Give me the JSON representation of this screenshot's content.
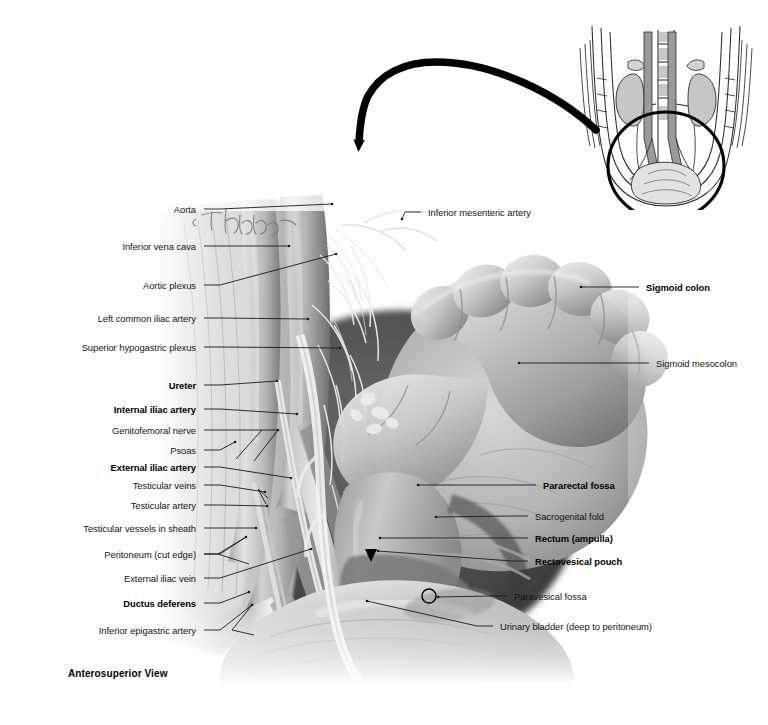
{
  "plate": {
    "view_label": "Anterosuperior View",
    "handwritten_mark": "T. Chubb",
    "illustration_type": "grayscale anatomical dissection photograph",
    "region": "male pelvis, peritoneum and posterior abdominal wall"
  },
  "labels_left": [
    {
      "id": "aorta",
      "text": "Aorta",
      "bold": false,
      "x": 196,
      "y": 209,
      "lx": 204,
      "ly": 209,
      "tx": 332,
      "ty": 204
    },
    {
      "id": "inferior-vena-cava",
      "text": "Inferior vena cava",
      "bold": false,
      "x": 196,
      "y": 246,
      "lx": 204,
      "ly": 246,
      "tx": 289,
      "ty": 246
    },
    {
      "id": "aortic-plexus",
      "text": "Aortic plexus",
      "bold": false,
      "x": 196,
      "y": 285,
      "lx": 204,
      "ly": 285,
      "tx": 336,
      "ty": 254
    },
    {
      "id": "left-common-iliac-artery",
      "text": "Left common iliac artery",
      "bold": false,
      "x": 196,
      "y": 318,
      "lx": 204,
      "ly": 318,
      "tx": 308,
      "ty": 319
    },
    {
      "id": "superior-hypogastric-plexus",
      "text": "Superior hypogastric plexus",
      "bold": false,
      "x": 196,
      "y": 347,
      "lx": 204,
      "ly": 347,
      "tx": 340,
      "ty": 348
    },
    {
      "id": "ureter",
      "text": "Ureter",
      "bold": true,
      "x": 196,
      "y": 385,
      "lx": 204,
      "ly": 385,
      "tx": 277,
      "ty": 381
    },
    {
      "id": "internal-iliac-artery",
      "text": "Internal iliac artery",
      "bold": true,
      "x": 196,
      "y": 409,
      "lx": 204,
      "ly": 409,
      "tx": 297,
      "ty": 414
    },
    {
      "id": "genitofemoral-nerve",
      "text": "Genitofemoral nerve",
      "bold": false,
      "x": 196,
      "y": 430,
      "lx": 204,
      "ly": 430,
      "tx": 278,
      "ty": 430
    },
    {
      "id": "psoas",
      "text": "Psoas",
      "bold": false,
      "x": 196,
      "y": 450,
      "lx": 204,
      "ly": 450,
      "tx": 235,
      "ty": 442
    },
    {
      "id": "external-iliac-artery",
      "text": "External iliac artery",
      "bold": true,
      "x": 196,
      "y": 467,
      "lx": 204,
      "ly": 467,
      "tx": 291,
      "ty": 478
    },
    {
      "id": "testicular-veins",
      "text": "Testicular veins",
      "bold": false,
      "x": 196,
      "y": 485,
      "lx": 204,
      "ly": 485,
      "tx": 265,
      "ty": 492
    },
    {
      "id": "testicular-artery",
      "text": "Testicular artery",
      "bold": false,
      "x": 196,
      "y": 505,
      "lx": 204,
      "ly": 505,
      "tx": 267,
      "ty": 506
    },
    {
      "id": "testicular-vessels-in-sheath",
      "text": "Testicular vessels in sheath",
      "bold": false,
      "x": 196,
      "y": 528,
      "lx": 204,
      "ly": 528,
      "tx": 256,
      "ty": 528
    },
    {
      "id": "peritoneum-cut-edge",
      "text": "Peritoneum (cut edge)",
      "bold": false,
      "x": 196,
      "y": 554,
      "lx": 204,
      "ly": 554,
      "tx": 246,
      "ty": 537
    },
    {
      "id": "external-iliac-vein",
      "text": "External iliac vein",
      "bold": false,
      "x": 196,
      "y": 578,
      "lx": 204,
      "ly": 578,
      "tx": 311,
      "ty": 549
    },
    {
      "id": "ductus-deferens",
      "text": "Ductus deferens",
      "bold": true,
      "x": 196,
      "y": 603,
      "lx": 204,
      "ly": 603,
      "tx": 249,
      "ty": 592
    },
    {
      "id": "inferior-epigastric-artery",
      "text": "Inferior epigastric artery",
      "bold": false,
      "x": 196,
      "y": 630,
      "lx": 204,
      "ly": 630,
      "tx": 252,
      "ty": 605
    }
  ],
  "labels_right": [
    {
      "id": "inferior-mesenteric-artery",
      "text": "Inferior mesenteric artery",
      "bold": false,
      "x": 428,
      "y": 212,
      "lx": 421,
      "ly": 212,
      "tx": 402,
      "ty": 219
    },
    {
      "id": "sigmoid-colon",
      "text": "Sigmoid colon",
      "bold": true,
      "x": 646,
      "y": 287,
      "lx": 639,
      "ly": 287,
      "tx": 581,
      "ty": 287
    },
    {
      "id": "sigmoid-mesocolon",
      "text": "Sigmoid mesocolon",
      "bold": false,
      "x": 656,
      "y": 363,
      "lx": 649,
      "ly": 363,
      "tx": 519,
      "ty": 363
    },
    {
      "id": "pararectal-fossa",
      "text": "Pararectal fossa",
      "bold": true,
      "x": 543,
      "y": 485,
      "lx": 536,
      "ly": 485,
      "tx": 418,
      "ty": 485
    },
    {
      "id": "sacrogenital-fold",
      "text": "Sacrogenital fold",
      "bold": false,
      "x": 535,
      "y": 516,
      "lx": 528,
      "ly": 516,
      "tx": 436,
      "ty": 517
    },
    {
      "id": "rectum-ampulla",
      "text": "Rectum (ampulla)",
      "bold": true,
      "x": 535,
      "y": 538,
      "lx": 528,
      "ly": 538,
      "tx": 380,
      "ty": 538
    },
    {
      "id": "rectovesical-pouch",
      "text": "Rectovesical pouch",
      "bold": true,
      "x": 535,
      "y": 561,
      "lx": 528,
      "ly": 561,
      "tx": 378,
      "ty": 551
    },
    {
      "id": "paravesical-fossa",
      "text": "Paravesical fossa",
      "bold": false,
      "x": 514,
      "y": 596,
      "lx": 507,
      "ly": 596,
      "tx": 438,
      "ty": 597
    },
    {
      "id": "urinary-bladder",
      "text": "Urinary bladder (deep to peritoneum)",
      "bold": false,
      "x": 500,
      "y": 626,
      "lx": 493,
      "ly": 626,
      "tx": 367,
      "ty": 601
    }
  ],
  "markers": {
    "paravesical_circle": {
      "name": "paravesical-fossa-circle-marker",
      "cx": 429,
      "cy": 596,
      "r": 7
    },
    "rectovesical_arrow": {
      "name": "rectovesical-pouch-arrowhead",
      "x": 371,
      "y": 558
    }
  },
  "orientation_arrow": {
    "name": "orientation-curved-arrow",
    "description": "thick black curved arrow from inset to main figure, pointing down-left"
  },
  "inset": {
    "name": "orientation-inset-diagram",
    "description": "line drawing of abdomen and pelvis in coronal view with kidneys, aorta, inferior vena cava and ureters; bold circle highlights pelvic region shown enlarged"
  },
  "colors": {
    "background": "#ffffff",
    "label_text": "#141414",
    "leader_line": "#1a1a1a",
    "ink": "#000000"
  }
}
